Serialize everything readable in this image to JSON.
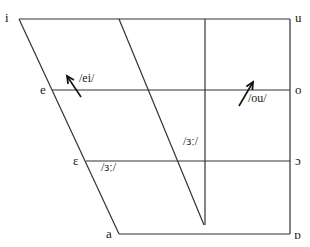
{
  "colors": {
    "line": "#333333",
    "text": "#1a1a1a",
    "background": "#ffffff"
  },
  "vowels": {
    "i": {
      "symbol": "i",
      "x": 5,
      "y": 11
    },
    "u": {
      "symbol": "u",
      "x": 295,
      "y": 11
    },
    "e": {
      "symbol": "e",
      "x": 40,
      "y": 83
    },
    "o": {
      "symbol": "o",
      "x": 295,
      "y": 83
    },
    "epsilon": {
      "symbol": "ε",
      "x": 73,
      "y": 154
    },
    "open_o": {
      "symbol": "ɔ",
      "x": 295,
      "y": 154
    },
    "a": {
      "symbol": "a",
      "x": 106,
      "y": 227
    },
    "script_a": {
      "symbol": "ɒ",
      "x": 294,
      "y": 228
    }
  },
  "annotations": {
    "ei": {
      "text": "/ei/",
      "x": 79,
      "y": 72
    },
    "ou": {
      "text": "/ou/",
      "x": 248,
      "y": 92
    },
    "er_mid": {
      "text": "/ɜː/",
      "x": 183,
      "y": 135
    },
    "er_low": {
      "text": "/ɜː/",
      "x": 101,
      "y": 161
    }
  },
  "lines": [
    {
      "name": "top-edge",
      "x1": 19,
      "y1": 19,
      "x2": 290,
      "y2": 19
    },
    {
      "name": "front-edge",
      "x1": 19,
      "y1": 19,
      "x2": 119,
      "y2": 234
    },
    {
      "name": "back-edge",
      "x1": 290,
      "y1": 19,
      "x2": 290,
      "y2": 234
    },
    {
      "name": "bottom-edge",
      "x1": 119,
      "y1": 234,
      "x2": 290,
      "y2": 234
    },
    {
      "name": "close-mid-line",
      "x1": 52,
      "y1": 90,
      "x2": 290,
      "y2": 90
    },
    {
      "name": "open-mid-line",
      "x1": 86,
      "y1": 161,
      "x2": 290,
      "y2": 161
    },
    {
      "name": "central-diagonal",
      "x1": 119,
      "y1": 19,
      "x2": 204,
      "y2": 225
    },
    {
      "name": "central-vertical",
      "x1": 205,
      "y1": 19,
      "x2": 205,
      "y2": 225
    }
  ],
  "arrows": [
    {
      "name": "ei-arrow",
      "x1": 81,
      "y1": 97,
      "x2": 67,
      "y2": 76
    },
    {
      "name": "ou-arrow",
      "x1": 239,
      "y1": 106,
      "x2": 253,
      "y2": 82
    }
  ]
}
